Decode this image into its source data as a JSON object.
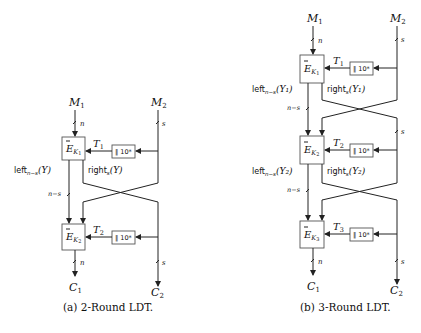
{
  "figure_a": {
    "caption": "(a) 2-Round LDT.",
    "inputs": {
      "left": "M",
      "left_sub": "1",
      "right": "M",
      "right_sub": "2"
    },
    "outputs": {
      "left": "C",
      "left_sub": "1",
      "right": "C",
      "right_sub": "2"
    },
    "wire_labels": {
      "n_top": "n",
      "s_top": "s",
      "n_minus_s": "n−s",
      "n_bottom": "n",
      "s_bottom": "s"
    },
    "rounds": [
      {
        "cipher": "E",
        "key_sub": "K",
        "key_num": "1",
        "tweak": "T",
        "tweak_sub": "1",
        "pad": "∥ 10*",
        "left_label": "left",
        "left_sub": "n−s",
        "left_arg": "(Y)",
        "right_label": "right",
        "right_sub": "s",
        "right_arg": "(Y)"
      },
      {
        "cipher": "E",
        "key_sub": "K",
        "key_num": "2",
        "tweak": "T",
        "tweak_sub": "2",
        "pad": "∥ 10*"
      }
    ]
  },
  "figure_b": {
    "caption": "(b) 3-Round LDT.",
    "inputs": {
      "left": "M",
      "left_sub": "1",
      "right": "M",
      "right_sub": "2"
    },
    "outputs": {
      "left": "C",
      "left_sub": "1",
      "right": "C",
      "right_sub": "2"
    },
    "wire_labels": {
      "n_top": "n",
      "s_top": "s",
      "n_minus_s_1": "n−s",
      "s_mid": "s",
      "n_minus_s_2": "n−s",
      "n_bottom": "n",
      "s_bottom": "s"
    },
    "rounds": [
      {
        "cipher": "E",
        "key_sub": "K",
        "key_num": "1",
        "tweak": "T",
        "tweak_sub": "1",
        "pad": "∥ 10*",
        "left_label": "left",
        "left_sub": "n−s",
        "left_arg": "(Y₁)",
        "right_label": "right",
        "right_sub": "s",
        "right_arg": "(Y₁)"
      },
      {
        "cipher": "E",
        "key_sub": "K",
        "key_num": "2",
        "tweak": "T",
        "tweak_sub": "2",
        "pad": "∥ 10*",
        "left_label": "left",
        "left_sub": "n−s",
        "left_arg": "(Y₂)",
        "right_label": "right",
        "right_sub": "s",
        "right_arg": "(Y₂)"
      },
      {
        "cipher": "E",
        "key_sub": "K",
        "key_num": "3",
        "tweak": "T",
        "tweak_sub": "3",
        "pad": "∥ 10*"
      }
    ]
  }
}
